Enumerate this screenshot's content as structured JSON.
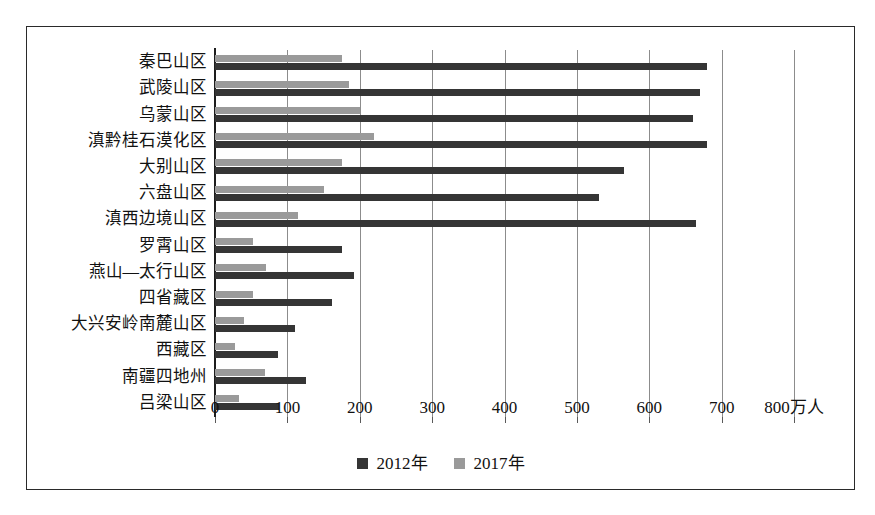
{
  "chart_data": {
    "type": "bar",
    "orientation": "horizontal",
    "title": "",
    "xlabel": "万人",
    "ylabel": "",
    "xlim": [
      0,
      800
    ],
    "xticks": [
      0,
      100,
      200,
      300,
      400,
      500,
      600,
      700,
      800
    ],
    "xtick_labels": [
      "0",
      "100",
      "200",
      "300",
      "400",
      "500",
      "600",
      "700",
      "800万人"
    ],
    "grid": "vertical",
    "legend_position": "bottom-center",
    "categories": [
      "秦巴山区",
      "武陵山区",
      "乌蒙山区",
      "滇黔桂石漠化区",
      "大别山区",
      "六盘山区",
      "滇西边境山区",
      "罗霄山区",
      "燕山—太行山区",
      "四省藏区",
      "大兴安岭南麓山区",
      "西藏区",
      "南疆四地州",
      "吕梁山区"
    ],
    "series": [
      {
        "name": "2012年",
        "color": "#353535",
        "values": [
          680,
          670,
          660,
          680,
          565,
          530,
          665,
          175,
          192,
          162,
          110,
          87,
          126,
          88
        ]
      },
      {
        "name": "2017年",
        "color": "#9a9a9a",
        "values": [
          175,
          185,
          200,
          220,
          175,
          150,
          115,
          52,
          70,
          52,
          40,
          28,
          69,
          33
        ]
      }
    ]
  },
  "legend": {
    "items": [
      {
        "label": "2012年",
        "swatch": "dark-square-swatch"
      },
      {
        "label": "2017年",
        "swatch": "light-square-swatch"
      }
    ]
  }
}
